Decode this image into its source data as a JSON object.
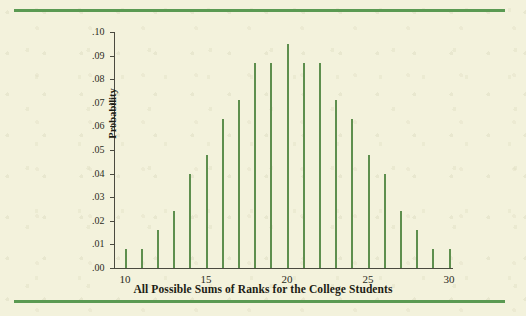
{
  "figure": {
    "background_color": "#f3f2dc",
    "rule_color": "#5a9a52",
    "bar_color": "#5e8f4e",
    "axis_color": "#4a4a3f"
  },
  "chart_data": {
    "type": "bar",
    "title": "",
    "xlabel": "All Possible Sums of Ranks for the College Students",
    "ylabel": "Probability",
    "categories": [
      10,
      11,
      12,
      13,
      14,
      15,
      16,
      17,
      18,
      19,
      20,
      21,
      22,
      23,
      24,
      25,
      26,
      27,
      28,
      29,
      30
    ],
    "values": [
      0.008,
      0.008,
      0.016,
      0.024,
      0.04,
      0.048,
      0.063,
      0.071,
      0.087,
      0.087,
      0.095,
      0.087,
      0.087,
      0.071,
      0.063,
      0.048,
      0.04,
      0.024,
      0.016,
      0.008,
      0.008
    ],
    "xlim": [
      9.5,
      30.8
    ],
    "ylim": [
      0.0,
      0.1
    ],
    "xticks": [
      10,
      11,
      12,
      13,
      14,
      15,
      16,
      17,
      18,
      19,
      20,
      21,
      22,
      23,
      24,
      25,
      26,
      27,
      28,
      29,
      30
    ],
    "xtick_labels_shown": [
      10,
      15,
      20,
      25,
      30
    ],
    "yticks": [
      0.0,
      0.01,
      0.02,
      0.03,
      0.04,
      0.05,
      0.06,
      0.07,
      0.08,
      0.09,
      0.1
    ],
    "ytick_labels": [
      ".00",
      ".01",
      ".02",
      ".03",
      ".04",
      ".05",
      ".06",
      ".07",
      ".08",
      ".09",
      ".10"
    ],
    "grid": false,
    "legend": null
  }
}
